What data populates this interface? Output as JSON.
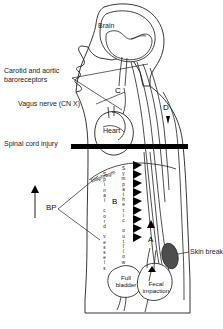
{
  "figure": {
    "type": "medical-diagram",
    "labels": {
      "brain": "Brain",
      "baroreceptors": "Carotid and aortic\nbaroreceptors",
      "baroreceptors_line1": "Carotid and aortic",
      "baroreceptors_line2": "baroreceptors",
      "vagus": "Vagus nerve (CN X)",
      "heart": "Heart",
      "spinal_cord_injury": "Spinal cord injury",
      "diaphragm": "Diaphragm",
      "bp": "BP",
      "skin_breakdown": "Skin breakdown",
      "full_bladder_line1": "Full",
      "full_bladder_line2": "bladder",
      "fecal_line1": "Fecal",
      "fecal_line2": "impaction",
      "spinal_cord_vessels": "Spinal cord vessels",
      "sympathetic_outflow": "Sympathetic outflow"
    },
    "markers": {
      "a": "A",
      "b": "B",
      "c": "C",
      "d": "D"
    },
    "colors": {
      "stroke": "#231f20",
      "fill_white": "#ffffff",
      "injury_bar": "#000000",
      "lesion": "#4d4d4d",
      "background": "#ffffff"
    }
  }
}
